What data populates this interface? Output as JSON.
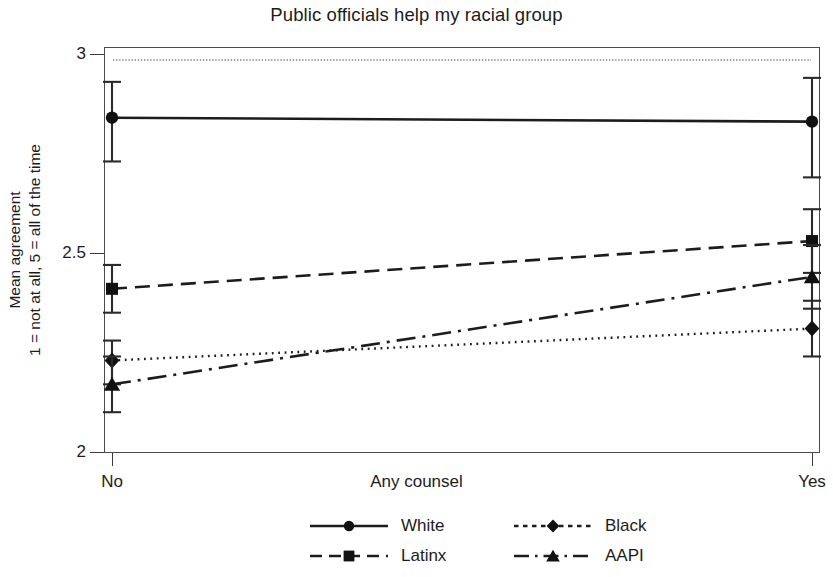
{
  "chart_data": {
    "type": "line",
    "title": "Public officials help my racial group",
    "xlabel": "Any counsel",
    "ylabel_line1": "Mean agreement",
    "ylabel_line2": "1 = not at all, 5 = all of the time",
    "categories": [
      "No",
      "Yes"
    ],
    "xticklabels": [
      "No",
      "Yes"
    ],
    "yticklabels": [
      "3",
      "2.5",
      "2"
    ],
    "ytickvalues": [
      3,
      2.5,
      2
    ],
    "ylim": [
      2,
      3
    ],
    "grid": false,
    "reference_line": 2.985,
    "legend_position": "bottom",
    "series": [
      {
        "name": "White",
        "linestyle": "solid",
        "marker": "circle",
        "values": [
          2.84,
          2.83
        ],
        "ci_low": [
          2.73,
          2.69
        ],
        "ci_high": [
          2.93,
          2.94
        ]
      },
      {
        "name": "Black",
        "linestyle": "dotted",
        "marker": "diamond",
        "values": [
          2.23,
          2.31
        ],
        "ci_low": [
          2.17,
          2.24
        ],
        "ci_high": [
          2.28,
          2.38
        ]
      },
      {
        "name": "Latinx",
        "linestyle": "dashed",
        "marker": "square",
        "values": [
          2.41,
          2.53
        ],
        "ci_low": [
          2.35,
          2.45
        ],
        "ci_high": [
          2.47,
          2.61
        ]
      },
      {
        "name": "AAPI",
        "linestyle": "dashdot",
        "marker": "triangle",
        "values": [
          2.17,
          2.44
        ],
        "ci_low": [
          2.1,
          2.36
        ],
        "ci_high": [
          2.24,
          2.52
        ]
      }
    ]
  },
  "legend": {
    "items": [
      {
        "label": "White"
      },
      {
        "label": "Black"
      },
      {
        "label": "Latinx"
      },
      {
        "label": "AAPI"
      }
    ]
  },
  "colors": {
    "ink": "#1c1c1c",
    "axis": "#3a3a3a",
    "background": "#ffffff"
  }
}
